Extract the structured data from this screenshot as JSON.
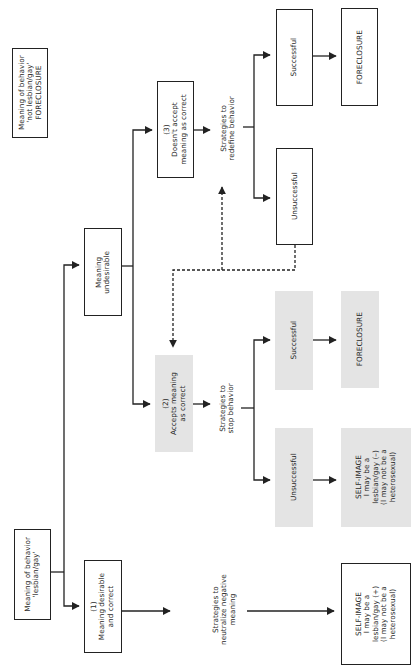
{
  "diagram": {
    "orientation": "rotated-90-ccw",
    "nodes": {
      "not_lesbian_gay": {
        "lines": [
          "Meaning of behavior",
          "'not lesbian/gay'",
          "FORECLOSURE"
        ]
      },
      "lesbian_gay": {
        "lines": [
          "Meaning of behavior",
          "'lesbian/gay'"
        ]
      },
      "undesirable": {
        "lines": [
          "Meaning",
          "undesirable"
        ]
      },
      "desirable": {
        "lines": [
          "(1)",
          "Meaning desirable",
          "and correct"
        ]
      },
      "doesnt_accept": {
        "lines": [
          "(3)",
          "Doesn't accept",
          "meaning as correct"
        ]
      },
      "accepts": {
        "lines": [
          "(2)",
          "Accepts meaning",
          "as correct"
        ]
      },
      "redefine_strategies": {
        "lines": [
          "Strategies to",
          "redefine behavior"
        ]
      },
      "stop_strategies": {
        "lines": [
          "Strategies to",
          "stop behavior"
        ]
      },
      "neutralize_strategies": {
        "lines": [
          "Strategies to",
          "neutralize negative",
          "meaning"
        ]
      },
      "redefine_successful": {
        "lines": [
          "Successful"
        ]
      },
      "redefine_foreclosure": {
        "lines": [
          "FORECLOSURE"
        ]
      },
      "redefine_unsuccessful": {
        "lines": [
          "Unsuccessful"
        ]
      },
      "stop_successful": {
        "lines": [
          "Successful"
        ]
      },
      "stop_foreclosure": {
        "lines": [
          "FORECLOSURE"
        ]
      },
      "stop_unsuccessful": {
        "lines": [
          "Unsuccessful"
        ]
      },
      "self_image_negative": {
        "lines": [
          "SELF-IMAGE",
          "I may be a",
          "lesbian/gay (–)",
          "(I may not be a",
          "heterosexual)"
        ]
      },
      "self_image_positive": {
        "lines": [
          "SELF-IMAGE",
          "I may be a",
          "lesbian/gay (+)",
          "(I may not be a",
          "heterosexual)"
        ]
      }
    },
    "colors": {
      "line": "#222222",
      "shaded_box": "#e4e4e4",
      "text": "#2a2a2a"
    }
  }
}
